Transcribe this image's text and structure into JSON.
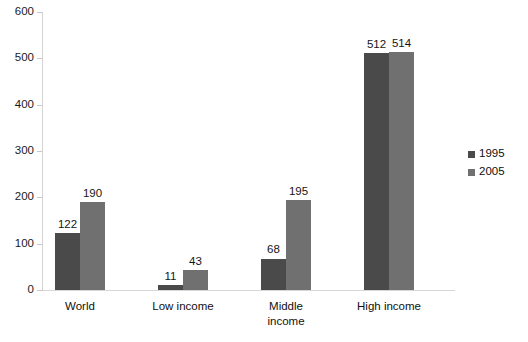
{
  "chart_data": {
    "type": "bar",
    "title": "",
    "xlabel": "",
    "ylabel": "",
    "ylim": [
      0,
      600
    ],
    "ytick_interval": 100,
    "yticks": [
      600,
      500,
      400,
      300,
      200,
      100,
      0
    ],
    "grid": false,
    "legend_position": "right",
    "categories": [
      "World",
      "Low income",
      "Middle income",
      "High income"
    ],
    "category_lines": [
      [
        "World"
      ],
      [
        "Low income"
      ],
      [
        "Middle",
        "income"
      ],
      [
        "High income"
      ]
    ],
    "series": [
      {
        "name": "1995",
        "color": "#4a4a4a",
        "values": [
          122,
          11,
          68,
          512
        ]
      },
      {
        "name": "2005",
        "color": "#707070",
        "values": [
          190,
          43,
          195,
          514
        ]
      }
    ],
    "data_labels": [
      [
        "122",
        "190"
      ],
      [
        "11",
        "43"
      ],
      [
        "68",
        "195"
      ],
      [
        "512",
        "514"
      ]
    ]
  },
  "axis": {
    "y_tick_labels": [
      "600",
      "500",
      "400",
      "300",
      "200",
      "100",
      "0"
    ]
  },
  "legend": {
    "items": [
      {
        "label": "1995",
        "color": "#4a4a4a",
        "swatch_name": "legend-swatch-1995"
      },
      {
        "label": "2005",
        "color": "#707070",
        "swatch_name": "legend-swatch-2005"
      }
    ]
  },
  "title_fragment": {
    "text": ""
  }
}
